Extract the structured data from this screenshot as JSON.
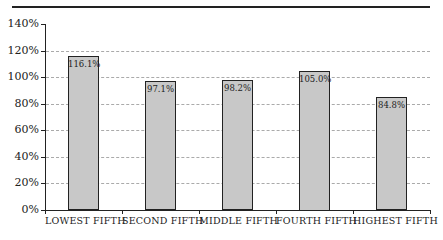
{
  "chart_data": {
    "type": "bar",
    "title": "",
    "xlabel": "",
    "ylabel": "",
    "categories": [
      "LOWEST FIFTH",
      "SECOND FIFTH",
      "MIDDLE FIFTH",
      "FOURTH FIFTH",
      "HIGHEST FIFTH"
    ],
    "values": [
      116.1,
      97.1,
      98.2,
      105.0,
      84.8
    ],
    "value_labels": [
      "116.1%",
      "97.1%",
      "98.2%",
      "105.0%",
      "84.8%"
    ],
    "ylim": [
      0,
      140
    ],
    "yticks": [
      "0%",
      "20%",
      "40%",
      "60%",
      "80%",
      "100%",
      "120%",
      "140%"
    ],
    "grid": true,
    "bar_color": "#c8c8c8",
    "legend": null
  }
}
